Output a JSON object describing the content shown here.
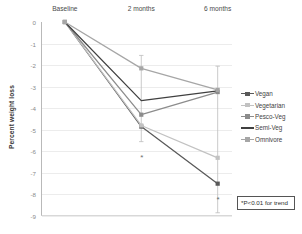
{
  "chart_data": {
    "type": "line",
    "title": "",
    "xlabel": "",
    "ylabel": "Percent weight loss",
    "categories": [
      "Baseline",
      "2 months",
      "6 months"
    ],
    "ylim": [
      -9,
      0
    ],
    "yticks": [
      0,
      -1,
      -2,
      -3,
      -4,
      -5,
      -6,
      -7,
      -8,
      -9
    ],
    "ytick_labels": [
      "0",
      "-1",
      "-2",
      "-3",
      "-4",
      "-5",
      "-6",
      "-7",
      "-8",
      "-9"
    ],
    "grid": true,
    "legend_position": "right",
    "xaxis_label_position": "top",
    "series": [
      {
        "name": "Vegan",
        "values": [
          0,
          -4.85,
          -7.5
        ],
        "color": "#595959"
      },
      {
        "name": "Vegetarian",
        "values": [
          0,
          -4.8,
          -6.3
        ],
        "color": "#c2c2c2"
      },
      {
        "name": "Pesco-Veg",
        "values": [
          0,
          -4.3,
          -3.25
        ],
        "color": "#8c8c8c"
      },
      {
        "name": "Semi-Veg",
        "values": [
          0,
          -3.65,
          -3.2
        ],
        "color": "#404040"
      },
      {
        "name": "Omnivore",
        "values": [
          0,
          -2.15,
          -3.15
        ],
        "color": "#a6a6a6"
      }
    ],
    "error_bars": [
      {
        "category": "2 months",
        "upper": -1.55,
        "lower": -5.55
      },
      {
        "category": "6 months",
        "upper": -2.05,
        "lower": -8.85
      }
    ],
    "annotations": [
      {
        "text": "*",
        "category": "2 months",
        "value": -6.3
      },
      {
        "text": "*",
        "category": "6 months",
        "value": -8.25
      }
    ],
    "note": {
      "line1": "*P<0.01 for",
      "line2": "trend"
    }
  }
}
